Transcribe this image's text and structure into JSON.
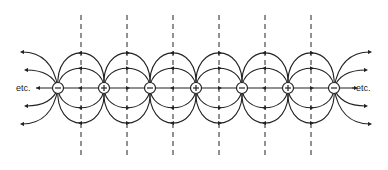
{
  "diagram": {
    "type": "electric-field-lines",
    "labels": {
      "left_continuation": "etc.",
      "right_continuation": "etc."
    },
    "axis_y": 88,
    "charges": [
      {
        "x": 58,
        "sign": "−"
      },
      {
        "x": 104,
        "sign": "+"
      },
      {
        "x": 150,
        "sign": "−"
      },
      {
        "x": 196,
        "sign": "+"
      },
      {
        "x": 242,
        "sign": "−"
      },
      {
        "x": 288,
        "sign": "+"
      },
      {
        "x": 334,
        "sign": "−"
      }
    ],
    "dashed_lines_x": [
      81,
      127,
      173,
      219,
      265,
      311
    ],
    "dashed_line_range": [
      15,
      158
    ],
    "loops": {
      "outer_half_height": 39,
      "inner_half_height": 22
    },
    "colors": {
      "line": "#222222",
      "background": "#ffffff"
    }
  }
}
